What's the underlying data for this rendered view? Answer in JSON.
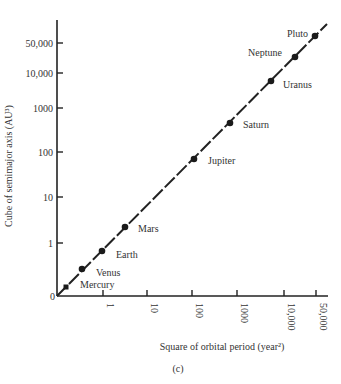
{
  "chart_data": {
    "type": "scatter",
    "title": "",
    "caption": "(c)",
    "xlabel": "Square of orbital period (year²)",
    "ylabel": "Cube of semimajor axis (AU³)",
    "x_scale": "log-like",
    "y_scale": "log-like",
    "x_ticks": [
      "1",
      "10",
      "100",
      "1000",
      "10,000",
      "50,000"
    ],
    "y_ticks": [
      "0",
      "1",
      "10",
      "100",
      "1000",
      "10,000",
      "50,000"
    ],
    "grid": false,
    "legend": null,
    "fit_line": "y = x (Kepler's third law)",
    "points": [
      {
        "name": "Mercury",
        "x": 0.058,
        "y": 0.058
      },
      {
        "name": "Venus",
        "x": 0.378,
        "y": 0.378
      },
      {
        "name": "Earth",
        "x": 1,
        "y": 1
      },
      {
        "name": "Mars",
        "x": 3.54,
        "y": 3.54
      },
      {
        "name": "Jupiter",
        "x": 141,
        "y": 141
      },
      {
        "name": "Saturn",
        "x": 868,
        "y": 868
      },
      {
        "name": "Uranus",
        "x": 7058,
        "y": 7058
      },
      {
        "name": "Neptune",
        "x": 27160,
        "y": 27160
      },
      {
        "name": "Pluto",
        "x": 61500,
        "y": 61500
      }
    ]
  }
}
